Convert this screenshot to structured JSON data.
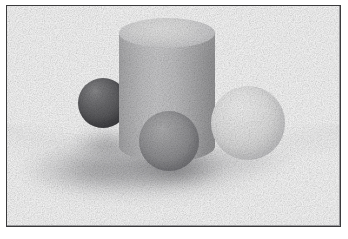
{
  "image": {
    "title": "Rendered 3D still life",
    "description": "Grayscale ray-traced scene: a tall cylinder with three spheres on a diffuse ground plane, enclosed in a thin dark rectangular frame",
    "width": 348,
    "height": 239,
    "background_color": "#ffffff",
    "render_style": "dithered grayscale raster render with visible pixel grain"
  },
  "frame": {
    "name": "picture-frame",
    "border_color": "#3a3a3c",
    "border_width_px": 1,
    "x": 6,
    "y": 5,
    "width": 335,
    "height": 222,
    "fill_color": "#ffffff"
  },
  "scene": {
    "lighting": "single soft key light from upper left, long soft shadow cast to the lower left",
    "ground": {
      "name": "ground-plane",
      "color": "#ffffff",
      "shadow_color": "#6a6a6e",
      "shadow_description": "soft grainy gray shadow pooling left and in front of the objects"
    },
    "objects": [
      {
        "name": "cylinder",
        "shape": "cylinder",
        "color": "#c4c4c6",
        "top_face_color": "#e6e6e6",
        "x": 119,
        "y": 18,
        "width": 96,
        "height": 144,
        "note": "tallest object, centered, lighter elliptical top face, vertical shading band light at left-of-center"
      },
      {
        "name": "dark-sphere",
        "shape": "sphere",
        "color": "#5a5a5d",
        "highlight_color": "#8b8b8d",
        "x": 78,
        "y": 78,
        "diameter": 50,
        "note": "small dark gray sphere at left, partially behind the cylinder"
      },
      {
        "name": "medium-sphere",
        "shape": "sphere",
        "color": "#939396",
        "highlight_color": "#b4b4b6",
        "x": 139,
        "y": 111,
        "diameter": 60,
        "note": "mid-gray sphere in front of the cylinder, lowest of the three"
      },
      {
        "name": "light-sphere",
        "shape": "sphere",
        "color": "#e4e4e4",
        "highlight_color": "#fbfbfb",
        "x": 211,
        "y": 86,
        "diameter": 74,
        "note": "largest, brightest sphere at right, overlapping the cylinder's right edge"
      }
    ]
  },
  "palette": {
    "white": "#ffffff",
    "frame_line": "#3a3a3c",
    "cylinder_body": "#c4c4c6",
    "cylinder_top": "#e6e6e6",
    "dark_sphere": "#5a5a5d",
    "medium_sphere": "#939396",
    "light_sphere": "#e4e4e4",
    "shadow": "#6a6a6e"
  }
}
